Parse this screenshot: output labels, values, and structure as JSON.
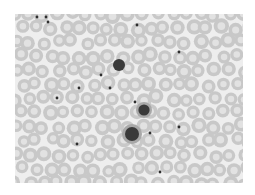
{
  "image": {
    "subject": "peripheral blood smear micrograph",
    "palette": {
      "background": "#ffffff",
      "plasma": "#eeeeee",
      "rbc": "#c8c8c8",
      "rbc_center": "#e2e2e2",
      "nucleus": "#3a3a3a",
      "platelet": "#2e2e2e",
      "cytoplasm": "#a8a8a8"
    },
    "rbc_grid": {
      "cols": 16,
      "rows": 12,
      "radius": 7
    },
    "dark_cells": [
      {
        "type": "lymphocyte",
        "cx": 104,
        "cy": 51,
        "r": 6
      },
      {
        "type": "neutrophil",
        "cx": 129,
        "cy": 96,
        "r": 8
      },
      {
        "type": "monocyte",
        "cx": 117,
        "cy": 120,
        "r": 10
      }
    ],
    "platelets": [
      {
        "cx": 31,
        "cy": 3
      },
      {
        "cx": 33,
        "cy": 8
      },
      {
        "cx": 22,
        "cy": 3
      },
      {
        "cx": 122,
        "cy": 11
      },
      {
        "cx": 164,
        "cy": 38
      },
      {
        "cx": 86,
        "cy": 61
      },
      {
        "cx": 64,
        "cy": 74
      },
      {
        "cx": 42,
        "cy": 84
      },
      {
        "cx": 120,
        "cy": 88
      },
      {
        "cx": 135,
        "cy": 119
      },
      {
        "cx": 62,
        "cy": 130
      },
      {
        "cx": 164,
        "cy": 113
      },
      {
        "cx": 145,
        "cy": 158
      },
      {
        "cx": 95,
        "cy": 74
      }
    ]
  }
}
